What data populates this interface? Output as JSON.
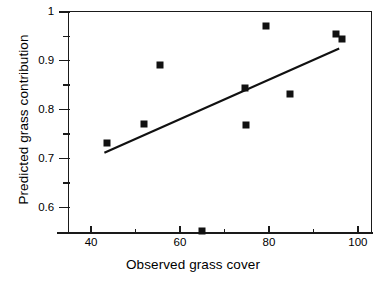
{
  "chart_data": {
    "type": "scatter",
    "title": "",
    "xlabel": "Observed grass cover",
    "ylabel": "Predicted grass contribution",
    "xlim": [
      35,
      103
    ],
    "ylim": [
      0.55,
      1.0
    ],
    "grid": false,
    "legend": null,
    "x_ticks_major": [
      40,
      60,
      80,
      100
    ],
    "x_ticks_major_labels": [
      "40",
      "60",
      "80",
      "100"
    ],
    "x_ticks_minor": [
      50,
      70,
      90
    ],
    "y_ticks_major": [
      0.6,
      0.7,
      0.8,
      0.9,
      1.0
    ],
    "y_ticks_major_labels": [
      "0.6",
      "0.7",
      "0.8",
      "0.9",
      "1"
    ],
    "y_ticks_minor": [
      0.65,
      0.75,
      0.85,
      0.95
    ],
    "points": [
      {
        "x": 43.5,
        "y": 0.731
      },
      {
        "x": 51.8,
        "y": 0.77
      },
      {
        "x": 55.5,
        "y": 0.891
      },
      {
        "x": 65.0,
        "y": 0.553
      },
      {
        "x": 74.6,
        "y": 0.845
      },
      {
        "x": 74.8,
        "y": 0.769
      },
      {
        "x": 79.3,
        "y": 0.97
      },
      {
        "x": 84.8,
        "y": 0.831
      },
      {
        "x": 95.0,
        "y": 0.955
      },
      {
        "x": 96.4,
        "y": 0.944
      }
    ],
    "trend_line": {
      "x_start": 43.0,
      "y_start": 0.712,
      "x_end": 95.8,
      "y_end": 0.925
    },
    "marker_style": "filled-square",
    "marker_color": "#111111",
    "line_color": "#111111"
  }
}
